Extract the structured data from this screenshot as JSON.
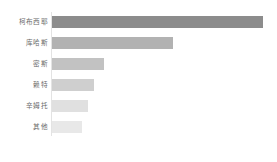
{
  "chart_data": {
    "type": "bar",
    "orientation": "horizontal",
    "title": "",
    "subtitle": "",
    "xlabel": "",
    "ylabel": "",
    "grid": false,
    "legend": false,
    "legend_position": "none",
    "axis": {
      "y_axis_line": true,
      "x_axis_line": false,
      "x_ticks": [],
      "x_tick_labels": [],
      "xlim": [
        0,
        210
      ]
    },
    "categories": [
      "柯布西耶",
      "库哈斯",
      "密斯",
      "赖特",
      "辛姆托",
      "其他"
    ],
    "values": [
      210,
      120,
      52,
      42,
      36,
      30
    ],
    "series": [
      {
        "name": "提及次数",
        "values": [
          210,
          120,
          52,
          42,
          36,
          30
        ]
      }
    ],
    "bars": [
      {
        "label": "柯布西耶",
        "value": 210,
        "color": "#8c8c8c"
      },
      {
        "label": "库哈斯",
        "value": 120,
        "color": "#b2b2b2"
      },
      {
        "label": "密斯",
        "value": 52,
        "color": "#c2c2c2"
      },
      {
        "label": "赖特",
        "value": 42,
        "color": "#cfcfcf"
      },
      {
        "label": "辛姆托",
        "value": 36,
        "color": "#e0e0e0"
      },
      {
        "label": "其他",
        "value": 30,
        "color": "#e8e8e8"
      }
    ],
    "colors": {
      "background": "#ffffff",
      "axis_line": "#e3e3e3",
      "label_text": "#6b6b6b"
    }
  }
}
